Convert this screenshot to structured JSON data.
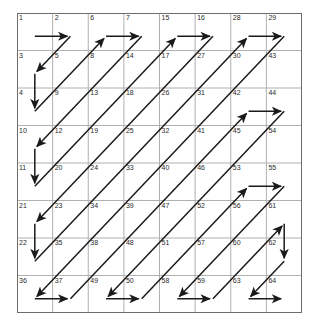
{
  "figure": {
    "name": "zigzag-scan-order-grid",
    "rows": 8,
    "cols": 8,
    "cell_width": 35.625,
    "cell_height": 37.5,
    "origin_x": 17,
    "origin_y": 13
  },
  "colors": {
    "background": "#ffffff",
    "outer_border": "#6d6d6d",
    "grid_line": "#b0b0b0",
    "path_line": "#1a1a1a",
    "label_text": "#2b2b2b"
  },
  "chart_data": {
    "type": "table",
    "title": "",
    "xlabel": "",
    "ylabel": "",
    "categories": [
      "c0",
      "c1",
      "c2",
      "c3",
      "c4",
      "c5",
      "c6",
      "c7"
    ],
    "rows": [
      [
        1,
        2,
        6,
        7,
        15,
        16,
        28,
        29
      ],
      [
        3,
        5,
        8,
        14,
        17,
        27,
        30,
        43
      ],
      [
        4,
        9,
        13,
        18,
        26,
        31,
        42,
        44
      ],
      [
        10,
        12,
        19,
        25,
        32,
        41,
        45,
        54
      ],
      [
        11,
        20,
        24,
        33,
        40,
        46,
        53,
        55
      ],
      [
        21,
        23,
        34,
        39,
        47,
        52,
        56,
        61
      ],
      [
        22,
        35,
        38,
        48,
        51,
        57,
        60,
        62
      ],
      [
        36,
        37,
        49,
        50,
        58,
        59,
        63,
        64
      ]
    ],
    "sequence": [
      [
        0,
        0
      ],
      [
        0,
        1
      ],
      [
        1,
        0
      ],
      [
        2,
        0
      ],
      [
        1,
        1
      ],
      [
        0,
        2
      ],
      [
        0,
        3
      ],
      [
        1,
        2
      ],
      [
        2,
        1
      ],
      [
        3,
        0
      ],
      [
        4,
        0
      ],
      [
        3,
        1
      ],
      [
        2,
        2
      ],
      [
        1,
        3
      ],
      [
        0,
        4
      ],
      [
        0,
        5
      ],
      [
        1,
        4
      ],
      [
        2,
        3
      ],
      [
        3,
        2
      ],
      [
        4,
        1
      ],
      [
        5,
        0
      ],
      [
        6,
        0
      ],
      [
        5,
        1
      ],
      [
        4,
        2
      ],
      [
        3,
        3
      ],
      [
        2,
        4
      ],
      [
        1,
        5
      ],
      [
        0,
        6
      ],
      [
        0,
        7
      ],
      [
        1,
        6
      ],
      [
        2,
        5
      ],
      [
        3,
        4
      ],
      [
        4,
        3
      ],
      [
        5,
        2
      ],
      [
        6,
        1
      ],
      [
        7,
        0
      ],
      [
        7,
        1
      ],
      [
        6,
        2
      ],
      [
        5,
        3
      ],
      [
        4,
        4
      ],
      [
        3,
        5
      ],
      [
        2,
        6
      ],
      [
        2,
        7
      ],
      [
        3,
        6
      ],
      [
        4,
        5
      ],
      [
        5,
        4
      ],
      [
        6,
        3
      ],
      [
        7,
        2
      ],
      [
        7,
        3
      ],
      [
        6,
        4
      ],
      [
        5,
        5
      ],
      [
        4,
        6
      ],
      [
        4,
        7
      ],
      [
        5,
        6
      ],
      [
        6,
        5
      ],
      [
        7,
        4
      ],
      [
        7,
        5
      ],
      [
        6,
        6
      ],
      [
        5,
        7
      ],
      [
        6,
        7
      ],
      [
        7,
        6
      ],
      [
        7,
        7
      ]
    ],
    "legend": [],
    "grid": true
  }
}
